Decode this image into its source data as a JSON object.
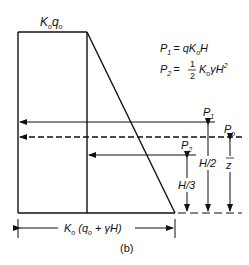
{
  "diagram": {
    "caption": "(b)",
    "top_label": {
      "main": "K",
      "sub": "o",
      "main2": "q",
      "sub2": "o"
    },
    "equations": {
      "p1": {
        "lhs": "P",
        "lhs_sub": "1",
        "rhs": "= qK",
        "rhs_sub": "o",
        "rhs_tail": "H"
      },
      "p2": {
        "lhs": "P",
        "lhs_sub": "2",
        "eq": "=",
        "frac_num": "1",
        "frac_den": "2",
        "rhs": "K",
        "rhs_sub": "o",
        "rhs_tail": "γH",
        "sup": "2"
      }
    },
    "forces": {
      "p1": {
        "label": "P",
        "sub": "1"
      },
      "p0": {
        "label": "P",
        "sub": "o"
      },
      "p2": {
        "label": "P",
        "sub": "2"
      }
    },
    "dimensions": {
      "h3": "H/3",
      "h2": "H/2",
      "zbar": "z",
      "base": {
        "pre": "K",
        "sub": "o",
        "mid": " (q",
        "sub2": "o",
        "post": " + γH)"
      }
    },
    "colors": {
      "line": "#111111",
      "background": "#ffffff"
    }
  }
}
